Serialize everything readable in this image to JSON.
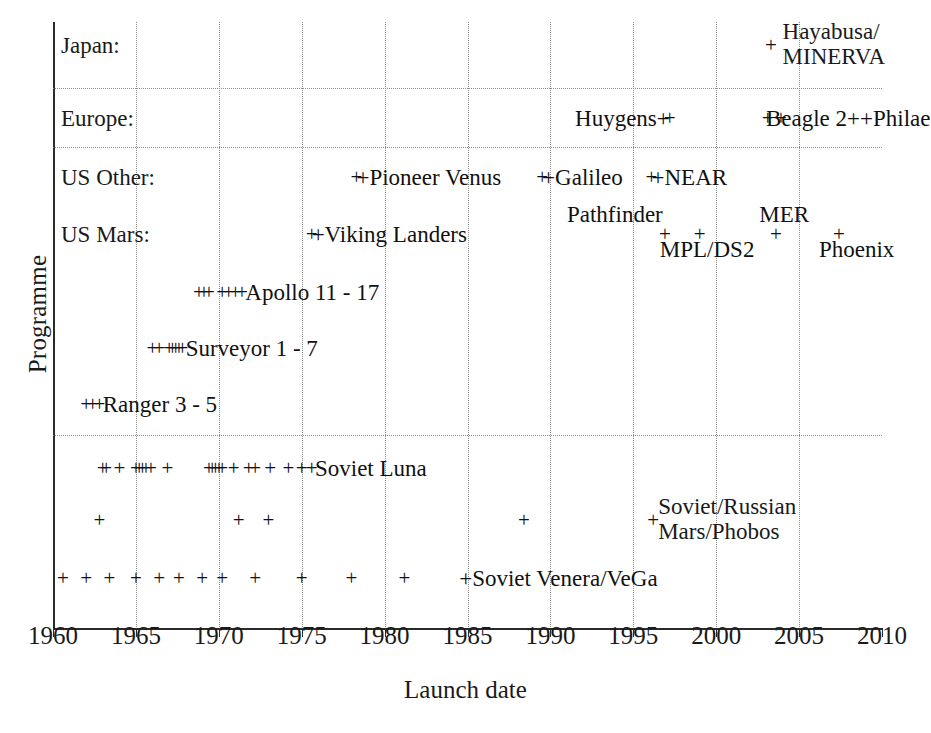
{
  "chart_data": {
    "type": "scatter",
    "title": "",
    "xlabel": "Launch date",
    "ylabel": "Programme",
    "xlim": [
      1960,
      2010
    ],
    "xticks": [
      "1960",
      "1965",
      "1970",
      "1975",
      "1980",
      "1985",
      "1990",
      "1995",
      "2000",
      "2005",
      "2010"
    ],
    "grid": "dotted vertical at every xtick; dotted horizontal separators between Japan/Europe, Europe/US Other, and above Soviet Luna",
    "marker": "+",
    "legend": "inline series labels next to marker groups",
    "rows": [
      {
        "name": "Japan",
        "row_label": "Japan:",
        "y": 45,
        "series_label": "Hayabusa/\nMINERVA",
        "label_lines": [
          "Hayabusa/",
          "MINERVA"
        ],
        "points": [
          2003.3
        ]
      },
      {
        "name": "Europe",
        "row_label": "Europe:",
        "y": 118,
        "points": [
          1997.2,
          2003.1,
          2003.9
        ],
        "inline_labels": [
          {
            "text": "Huygens+",
            "x": 1997.2,
            "align": "right"
          },
          {
            "text": "Beagle 2++Philae",
            "x": 2003.1,
            "align": "left"
          }
        ]
      },
      {
        "name": "US Other",
        "row_label": "US Other:",
        "y": 177,
        "points": [
          1978.3,
          1989.5,
          1996.1
        ],
        "inline_labels": [
          {
            "text": "+Pioneer Venus",
            "x": 1978.3,
            "align": "left"
          },
          {
            "text": "+Galileo",
            "x": 1989.5,
            "align": "left"
          },
          {
            "text": "+NEAR",
            "x": 1996.1,
            "align": "left"
          }
        ]
      },
      {
        "name": "US Mars",
        "row_label": "US Mars:",
        "y": 234,
        "points": [
          1975.6,
          1996.9,
          1999.0,
          2003.6,
          2007.4
        ],
        "inline_labels": [
          {
            "text": "+Viking Landers",
            "x": 1975.6,
            "align": "left"
          }
        ],
        "above_labels": [
          {
            "text": "Pathfinder",
            "x": 1993.0
          },
          {
            "text": "MER",
            "x": 2003.6
          }
        ],
        "below_labels": [
          {
            "text": "MPL/DS2",
            "x": 1998.0
          },
          {
            "text": "Phoenix",
            "x": 2007.4
          }
        ]
      },
      {
        "name": "Apollo 11 - 17",
        "y": 292,
        "series_label": "Apollo 11 - 17",
        "points": [
          1968.8,
          1969.1,
          1969.4,
          1970.2,
          1970.6,
          1971.0,
          1971.4
        ]
      },
      {
        "name": "Surveyor 1 - 7",
        "y": 348,
        "series_label": "Surveyor 1 - 7",
        "points": [
          1966.0,
          1966.4,
          1967.0,
          1967.2,
          1967.4,
          1967.6,
          1967.8
        ]
      },
      {
        "name": "Ranger 3 - 5",
        "y": 404,
        "series_label": "Ranger 3 - 5",
        "points": [
          1962.0,
          1962.4,
          1962.8
        ]
      },
      {
        "name": "Soviet Luna",
        "y": 468,
        "series_label": "Soviet Luna",
        "points": [
          1963.0,
          1963.2,
          1964.0,
          1965.0,
          1965.2,
          1965.4,
          1965.6,
          1965.9,
          1966.9,
          1969.4,
          1969.6,
          1969.8,
          1970.0,
          1970.2,
          1970.9,
          1971.8,
          1972.2,
          1973.1,
          1974.2,
          1975.0,
          1975.6
        ]
      },
      {
        "name": "Soviet/Russian Mars/Phobos",
        "y": 520,
        "series_label": "Soviet/Russian\nMars/Phobos",
        "label_lines": [
          "Soviet/Russian",
          "Mars/Phobos"
        ],
        "points": [
          1962.8,
          1971.2,
          1973.0,
          1988.4,
          1996.2
        ]
      },
      {
        "name": "Soviet Venera/VeGa",
        "y": 578,
        "series_label": "Soviet Venera/VeGa",
        "points": [
          1960.6,
          1962.0,
          1963.4,
          1965.0,
          1966.4,
          1967.6,
          1969.0,
          1970.2,
          1972.2,
          1975.0,
          1978.0,
          1981.2
        ]
      }
    ]
  },
  "axis": {
    "x_title": "Launch date",
    "y_title": "Programme",
    "xticks": [
      "1960",
      "1965",
      "1970",
      "1975",
      "1980",
      "1985",
      "1990",
      "1995",
      "2000",
      "2005",
      "2010"
    ]
  },
  "row_labels": {
    "japan": "Japan:",
    "europe": "Europe:",
    "us_other": "US Other:",
    "us_mars": "US Mars:"
  },
  "labels": {
    "hayabusa_l1": "Hayabusa/",
    "hayabusa_l2": "MINERVA",
    "huygens": "Huygens+",
    "beagle_philae": "Beagle 2++Philae",
    "pioneer_venus": "+Pioneer Venus",
    "galileo": "+Galileo",
    "near": "+NEAR",
    "pathfinder": "Pathfinder",
    "viking": "+Viking Landers",
    "mpl_ds2": "MPL/DS2",
    "mer": "MER",
    "phoenix": "Phoenix",
    "apollo": "Apollo 11 - 17",
    "surveyor": "Surveyor 1 - 7",
    "ranger": "Ranger 3 - 5",
    "soviet_luna": "Soviet Luna",
    "soviet_mars_l1": "Soviet/Russian",
    "soviet_mars_l2": "Mars/Phobos",
    "venera": "+Soviet Venera/VeGa"
  },
  "colors": {
    "axis": "#2a2a2a",
    "grid": "#8a8a8a",
    "text": "#111111",
    "background": "#ffffff"
  }
}
